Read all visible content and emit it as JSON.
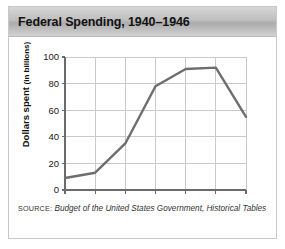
{
  "chart_data": {
    "type": "line",
    "title": "Federal Spending, 1940–1946",
    "xlabel": "",
    "ylabel": "Dollars spent",
    "ylabel_unit": "(in billions)",
    "categories": [
      "1940",
      "1941",
      "1942",
      "1943",
      "1944",
      "1945",
      "1946"
    ],
    "x": [
      1940,
      1941,
      1942,
      1943,
      1944,
      1945,
      1946
    ],
    "values": [
      9,
      13,
      35,
      78,
      91,
      92,
      55
    ],
    "series": [
      {
        "name": "Federal spending",
        "values": [
          9,
          13,
          35,
          78,
          91,
          92,
          55
        ]
      }
    ],
    "ylim": [
      0,
      100
    ],
    "yticks": [
      0,
      20,
      40,
      60,
      80,
      100
    ],
    "ytick_labels": [
      "0",
      "20",
      "40",
      "60",
      "80",
      "100"
    ],
    "xtick_labels": [
      "1940",
      "1941",
      "1942",
      "1943",
      "1944",
      "1945",
      "1946"
    ],
    "grid": true,
    "grid_axis": "both",
    "legend": false,
    "legend_position": "none",
    "line_color": "#6e6e6e",
    "grid_color": "#c9c9c9",
    "axis_color": "#6b6b6b",
    "title_band_color": "#c0c0c0",
    "border_color": "#c8c8c8"
  },
  "source": {
    "label": "SOURCE:",
    "text": "Budget of the United States Government, Historical Tables"
  }
}
